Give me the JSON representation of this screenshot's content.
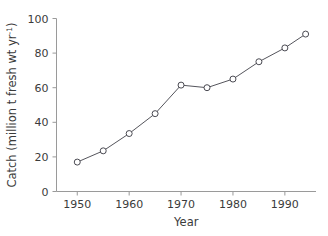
{
  "chart_data": {
    "type": "line",
    "title": "",
    "xlabel": "Year",
    "ylabel": "Catch (million t fresh wt yr",
    "ylabel_superscript": "-1",
    "ylabel_suffix": ")",
    "x": [
      1950,
      1955,
      1960,
      1965,
      1970,
      1975,
      1980,
      1985,
      1990,
      1994
    ],
    "values": [
      17,
      23.5,
      33.5,
      45,
      61.5,
      60,
      65,
      75,
      83,
      91
    ],
    "xlim": [
      1946,
      1996
    ],
    "ylim": [
      0,
      100
    ],
    "xticks": [
      1950,
      1960,
      1970,
      1980,
      1990
    ],
    "xtick_labels": [
      "1950",
      "1960",
      "1970",
      "1980",
      "1990"
    ],
    "yticks": [
      0,
      20,
      40,
      60,
      80,
      100
    ],
    "ytick_labels": [
      "0",
      "20",
      "40",
      "60",
      "80",
      "100"
    ],
    "grid": false,
    "legend": false,
    "marker": "open-circle",
    "line_color": "#55555c",
    "marker_edge_color": "#4a4a52",
    "marker_face_color": "#ffffff",
    "axis_color": "#9a9a9a",
    "text_color": "#3b3b3b",
    "background": "#ffffff"
  }
}
